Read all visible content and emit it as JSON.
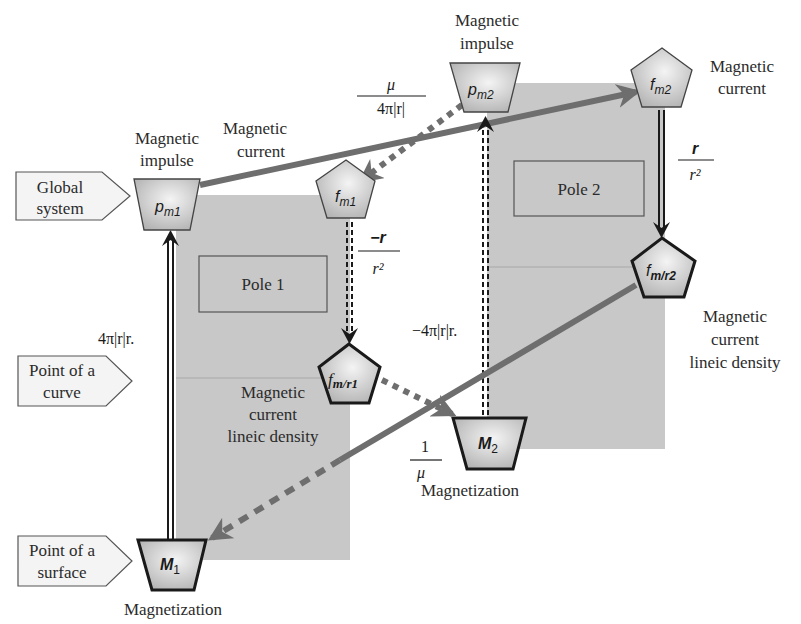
{
  "colors": {
    "pole_fill": "#c8c8c8",
    "node_fill": "#d6d6d6",
    "arrow_gray": "#6e6e6e",
    "stroke_dark": "#1a1a1a",
    "text": "#2b2b2b",
    "tag_fill": "#f4f4f4"
  },
  "side_tags": [
    {
      "id": "global-system",
      "line1": "Global",
      "line2": "system"
    },
    {
      "id": "point-of-a-curve",
      "line1": "Point of a",
      "line2": "curve"
    },
    {
      "id": "point-of-a-surface",
      "line1": "Point of a",
      "line2": "surface"
    }
  ],
  "poles": [
    {
      "id": "pole-1",
      "label": "Pole 1"
    },
    {
      "id": "pole-2",
      "label": "Pole 2"
    }
  ],
  "nodes": {
    "pm1": {
      "base": "p",
      "sub": "m1",
      "caption1": "Magnetic",
      "caption2": "impulse"
    },
    "pm2": {
      "base": "p",
      "sub": "m2",
      "caption1": "Magnetic",
      "caption2": "impulse"
    },
    "fm1": {
      "base": "f",
      "sub": "m1"
    },
    "fm2": {
      "base": "f",
      "sub": "m2",
      "caption1": "Magnetic",
      "caption2": "current"
    },
    "fmr1": {
      "base": "f",
      "sub": "m/r1",
      "caption1": "Magnetic",
      "caption2": "current",
      "caption3": "lineic density"
    },
    "fmr2": {
      "base": "f",
      "sub": "m/r2",
      "caption1": "Magnetic",
      "caption2": "current",
      "caption3": "lineic density"
    },
    "M1": {
      "base": "M",
      "sub": "1",
      "caption1": "Magnetization"
    },
    "M2": {
      "base": "M",
      "sub": "2",
      "caption1": "Magnetization"
    }
  },
  "edge_labels": {
    "current_top": {
      "line1": "Magnetic",
      "line2": "current"
    },
    "mu_over": {
      "num": "μ",
      "den": "4π|r|"
    },
    "neg_r_over": {
      "num": "−r",
      "den": "r²"
    },
    "r_over": {
      "num": "r",
      "den": "r²"
    },
    "left_vertical": "4π|r|r.",
    "mid_vertical": "−4π|r|r.",
    "one_over_mu": {
      "num": "1",
      "den": "μ"
    }
  }
}
